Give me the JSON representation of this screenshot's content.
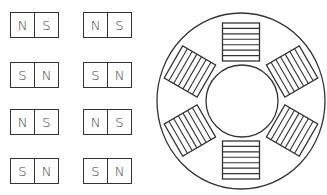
{
  "magnets": [
    {
      "poles": [
        "N",
        "S"
      ],
      "x": 10,
      "y": 12
    },
    {
      "poles": [
        "N",
        "S"
      ],
      "x": 83,
      "y": 12
    },
    {
      "poles": [
        "S",
        "N"
      ],
      "x": 10,
      "y": 62
    },
    {
      "poles": [
        "S",
        "N"
      ],
      "x": 83,
      "y": 62
    },
    {
      "poles": [
        "N",
        "S"
      ],
      "x": 10,
      "y": 109
    },
    {
      "poles": [
        "N",
        "S"
      ],
      "x": 83,
      "y": 109
    },
    {
      "poles": [
        "S",
        "N"
      ],
      "x": 10,
      "y": 158
    },
    {
      "poles": [
        "S",
        "N"
      ],
      "x": 83,
      "y": 158
    }
  ],
  "motor": {
    "center": [
      241,
      101
    ],
    "outer_radius": [
      84,
      88
    ],
    "inner_radius": 36,
    "coil_count": 6,
    "coil_angles_deg": [
      0,
      60,
      120,
      180,
      240,
      300
    ],
    "coil_strips": 7,
    "stroke_color": "#333333"
  }
}
